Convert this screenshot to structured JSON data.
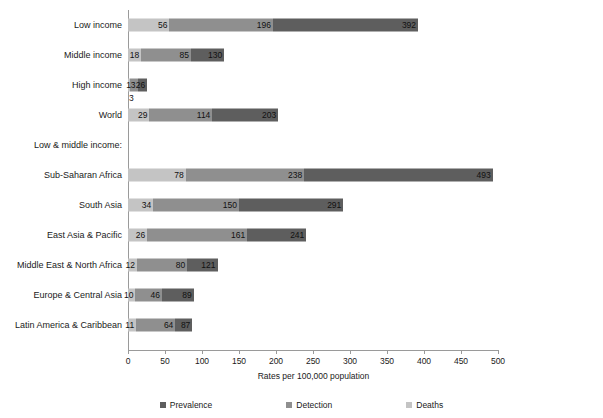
{
  "chart_data": {
    "type": "bar",
    "subtype": "horizontal-stacked",
    "title": "",
    "xlabel": "Rates per 100,000 population",
    "ylabel": "",
    "xlim": [
      0,
      500
    ],
    "xticks": [
      0,
      50,
      100,
      150,
      200,
      250,
      300,
      350,
      400,
      450,
      500
    ],
    "grid": false,
    "legend_position": "bottom",
    "categories": [
      "Low income",
      "Middle income",
      "High income",
      "World",
      "Sub-Saharan Africa",
      "South Asia",
      "East Asia & Pacific",
      "Middle East & North Africa",
      "Europe & Central Asia",
      "Latin America & Caribbean"
    ],
    "series": [
      {
        "name": "Deaths",
        "color": "#c4c4c4",
        "values": [
          56,
          18,
          3,
          29,
          78,
          34,
          26,
          12,
          10,
          11
        ]
      },
      {
        "name": "Detection",
        "color": "#8f8f8f",
        "values": [
          196,
          85,
          13,
          114,
          238,
          150,
          161,
          80,
          46,
          64
        ]
      },
      {
        "name": "Prevalence",
        "color": "#5e5e5e",
        "values": [
          392,
          130,
          26,
          203,
          493,
          291,
          241,
          121,
          89,
          87
        ]
      }
    ],
    "note": "Series values are cumulative endpoints of each stacked segment, matching the printed data labels."
  },
  "rows": [
    {
      "label": "Low income",
      "type": "bar",
      "segments": [
        {
          "series": "Deaths",
          "start": 0,
          "end": 56,
          "label": "56"
        },
        {
          "series": "Detection",
          "start": 56,
          "end": 196,
          "label": "196"
        },
        {
          "series": "Prevalence",
          "start": 196,
          "end": 392,
          "label": "392"
        }
      ]
    },
    {
      "label": "Middle income",
      "type": "bar",
      "segments": [
        {
          "series": "Deaths",
          "start": 0,
          "end": 18,
          "label": "18"
        },
        {
          "series": "Detection",
          "start": 18,
          "end": 85,
          "label": "85"
        },
        {
          "series": "Prevalence",
          "start": 85,
          "end": 130,
          "label": "130"
        }
      ]
    },
    {
      "label": "High income",
      "type": "bar",
      "segments": [
        {
          "series": "Deaths",
          "start": 0,
          "end": 3,
          "label": "3",
          "label_position": "below"
        },
        {
          "series": "Detection",
          "start": 3,
          "end": 13,
          "label": "13"
        },
        {
          "series": "Prevalence",
          "start": 13,
          "end": 26,
          "label": "26"
        }
      ]
    },
    {
      "label": "World",
      "type": "bar",
      "segments": [
        {
          "series": "Deaths",
          "start": 0,
          "end": 29,
          "label": "29"
        },
        {
          "series": "Detection",
          "start": 29,
          "end": 114,
          "label": "114"
        },
        {
          "series": "Prevalence",
          "start": 114,
          "end": 203,
          "label": "203"
        }
      ]
    },
    {
      "label": "Low & middle income:",
      "type": "section"
    },
    {
      "label": "Sub-Saharan Africa",
      "type": "bar",
      "segments": [
        {
          "series": "Deaths",
          "start": 0,
          "end": 78,
          "label": "78"
        },
        {
          "series": "Detection",
          "start": 78,
          "end": 238,
          "label": "238"
        },
        {
          "series": "Prevalence",
          "start": 238,
          "end": 493,
          "label": "493"
        }
      ]
    },
    {
      "label": "South Asia",
      "type": "bar",
      "segments": [
        {
          "series": "Deaths",
          "start": 0,
          "end": 34,
          "label": "34"
        },
        {
          "series": "Detection",
          "start": 34,
          "end": 150,
          "label": "150"
        },
        {
          "series": "Prevalence",
          "start": 150,
          "end": 291,
          "label": "291"
        }
      ]
    },
    {
      "label": "East Asia & Pacific",
      "type": "bar",
      "segments": [
        {
          "series": "Deaths",
          "start": 0,
          "end": 26,
          "label": "26"
        },
        {
          "series": "Detection",
          "start": 26,
          "end": 161,
          "label": "161"
        },
        {
          "series": "Prevalence",
          "start": 161,
          "end": 241,
          "label": "241"
        }
      ]
    },
    {
      "label": "Middle East & North Africa",
      "type": "bar",
      "segments": [
        {
          "series": "Deaths",
          "start": 0,
          "end": 12,
          "label": "12"
        },
        {
          "series": "Detection",
          "start": 12,
          "end": 80,
          "label": "80"
        },
        {
          "series": "Prevalence",
          "start": 80,
          "end": 121,
          "label": "121"
        }
      ]
    },
    {
      "label": "Europe & Central Asia",
      "type": "bar",
      "segments": [
        {
          "series": "Deaths",
          "start": 0,
          "end": 10,
          "label": "10"
        },
        {
          "series": "Detection",
          "start": 10,
          "end": 46,
          "label": "46"
        },
        {
          "series": "Prevalence",
          "start": 46,
          "end": 89,
          "label": "89"
        }
      ]
    },
    {
      "label": "Latin America & Caribbean",
      "type": "bar",
      "segments": [
        {
          "series": "Deaths",
          "start": 0,
          "end": 11,
          "label": "11"
        },
        {
          "series": "Detection",
          "start": 11,
          "end": 64,
          "label": "64"
        },
        {
          "series": "Prevalence",
          "start": 64,
          "end": 87,
          "label": "87"
        }
      ]
    }
  ],
  "axis": {
    "x_title": "Rates per 100,000 population",
    "tick_labels": [
      "0",
      "50",
      "100",
      "150",
      "200",
      "250",
      "300",
      "350",
      "400",
      "450",
      "500"
    ]
  },
  "legend": [
    {
      "label": "Prevalence",
      "color": "#5e5e5e"
    },
    {
      "label": "Detection",
      "color": "#8f8f8f"
    },
    {
      "label": "Deaths",
      "color": "#c4c4c4"
    }
  ]
}
